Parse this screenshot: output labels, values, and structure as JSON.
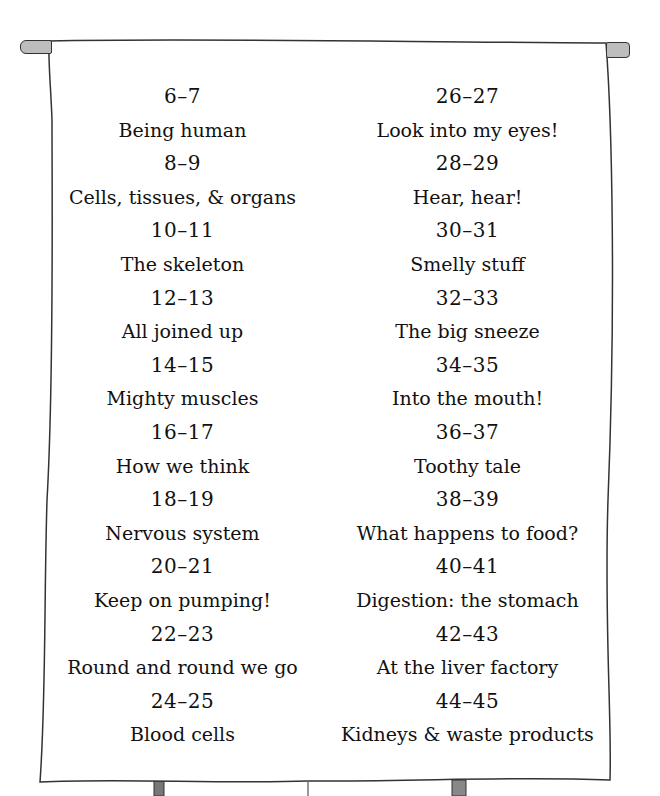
{
  "contents": {
    "left_column": [
      {
        "pages": "6–7",
        "title": "Being human"
      },
      {
        "pages": "8–9",
        "title": "Cells, tissues, & organs"
      },
      {
        "pages": "10–11",
        "title": "The skeleton"
      },
      {
        "pages": "12–13",
        "title": "All joined up"
      },
      {
        "pages": "14–15",
        "title": "Mighty muscles"
      },
      {
        "pages": "16–17",
        "title": "How we think"
      },
      {
        "pages": "18–19",
        "title": "Nervous system"
      },
      {
        "pages": "20–21",
        "title": "Keep on pumping!"
      },
      {
        "pages": "22–23",
        "title": "Round and round we go"
      },
      {
        "pages": "24–25",
        "title": "Blood cells"
      }
    ],
    "right_column": [
      {
        "pages": "26–27",
        "title": "Look into my eyes!"
      },
      {
        "pages": "28–29",
        "title": "Hear, hear!"
      },
      {
        "pages": "30–31",
        "title": "Smelly stuff"
      },
      {
        "pages": "32–33",
        "title": "The big sneeze"
      },
      {
        "pages": "34–35",
        "title": "Into the mouth!"
      },
      {
        "pages": "36–37",
        "title": "Toothy tale"
      },
      {
        "pages": "38–39",
        "title": "What happens to food?"
      },
      {
        "pages": "40–41",
        "title": "Digestion: the stomach"
      },
      {
        "pages": "42–43",
        "title": "At the liver factory"
      },
      {
        "pages": "44–45",
        "title": "Kidneys & waste products"
      }
    ]
  },
  "colors": {
    "paper": "#ffffff",
    "outline": "#333333",
    "rod": "#bdbdbd",
    "text": "#111111"
  }
}
